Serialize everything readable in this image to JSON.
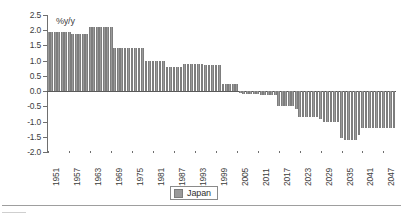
{
  "chart_data": {
    "type": "bar",
    "title": "",
    "xlabel": "",
    "ylabel": "%y/y",
    "ylim": [
      -2.0,
      2.5
    ],
    "ytick_labels": [
      "2.5",
      "2.0",
      "1.5",
      "1.0",
      "0.5",
      "0.0",
      "-0.5",
      "-1.0",
      "-1.5",
      "-2.0"
    ],
    "ytick_values": [
      2.5,
      2.0,
      1.5,
      1.0,
      0.5,
      0.0,
      -0.5,
      -1.0,
      -1.5,
      -2.0
    ],
    "xtick_labels": [
      "1951",
      "1957",
      "1963",
      "1969",
      "1975",
      "1981",
      "1987",
      "1993",
      "1999",
      "2005",
      "2011",
      "2017",
      "2023",
      "2029",
      "2035",
      "2041",
      "2047"
    ],
    "xtick_values": [
      1951,
      1957,
      1963,
      1969,
      1975,
      1981,
      1987,
      1993,
      1999,
      2005,
      2011,
      2017,
      2023,
      2029,
      2035,
      2041,
      2047
    ],
    "grid": false,
    "legend": {
      "position": "bottom-center",
      "entries": [
        "Japan"
      ]
    },
    "series": [
      {
        "name": "Japan",
        "color": "#9a9a9a",
        "x": [
          1951,
          1952,
          1953,
          1954,
          1955,
          1956,
          1957,
          1958,
          1959,
          1960,
          1961,
          1962,
          1963,
          1964,
          1965,
          1966,
          1967,
          1968,
          1969,
          1970,
          1971,
          1972,
          1973,
          1974,
          1975,
          1976,
          1977,
          1978,
          1979,
          1980,
          1981,
          1982,
          1983,
          1984,
          1985,
          1986,
          1987,
          1988,
          1989,
          1990,
          1991,
          1992,
          1993,
          1994,
          1995,
          1996,
          1997,
          1998,
          1999,
          2000,
          2001,
          2002,
          2003,
          2004,
          2005,
          2006,
          2007,
          2008,
          2009,
          2010,
          2011,
          2012,
          2013,
          2014,
          2015,
          2016,
          2017,
          2018,
          2019,
          2020,
          2021,
          2022,
          2023,
          2024,
          2025,
          2026,
          2027,
          2028,
          2029,
          2030,
          2031,
          2032,
          2033,
          2034,
          2035,
          2036,
          2037,
          2038,
          2039,
          2040,
          2041,
          2042,
          2043,
          2044,
          2045,
          2046,
          2047,
          2048,
          2049,
          2050
        ],
        "values": [
          1.95,
          1.95,
          1.95,
          1.95,
          1.95,
          1.95,
          1.95,
          1.88,
          1.88,
          1.88,
          1.88,
          1.88,
          2.1,
          2.1,
          2.1,
          2.1,
          2.1,
          2.1,
          2.1,
          1.4,
          1.4,
          1.4,
          1.4,
          1.4,
          1.4,
          1.4,
          1.4,
          1.4,
          1.0,
          1.0,
          1.0,
          1.0,
          1.0,
          1.0,
          0.8,
          0.8,
          0.8,
          0.8,
          0.8,
          0.9,
          0.9,
          0.9,
          0.9,
          0.9,
          0.9,
          0.85,
          0.85,
          0.85,
          0.85,
          0.85,
          0.25,
          0.25,
          0.25,
          0.25,
          0.22,
          -0.05,
          -0.08,
          -0.1,
          -0.1,
          -0.1,
          -0.1,
          -0.12,
          -0.12,
          -0.12,
          -0.12,
          -0.12,
          -0.5,
          -0.5,
          -0.5,
          -0.5,
          -0.5,
          -0.6,
          -0.85,
          -0.85,
          -0.85,
          -0.85,
          -0.85,
          -0.85,
          -0.9,
          -1.0,
          -1.0,
          -1.0,
          -1.0,
          -1.0,
          -1.55,
          -1.6,
          -1.6,
          -1.6,
          -1.6,
          -1.45,
          -1.2,
          -1.2,
          -1.2,
          -1.2,
          -1.2,
          -1.2,
          -1.2,
          -1.2,
          -1.2,
          -1.2
        ]
      }
    ]
  },
  "legend": {
    "label": "Japan"
  }
}
